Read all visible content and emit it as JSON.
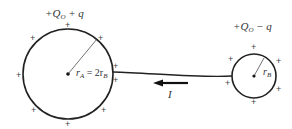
{
  "diagram": {
    "sphere_a": {
      "charge_label_prefix": "+Q",
      "charge_label_sub": "O",
      "charge_label_suffix": " + q",
      "radius_label_r": "r",
      "radius_label_sub": "A",
      "radius_label_eq": " = 2r",
      "radius_label_sub2": "B"
    },
    "sphere_b": {
      "charge_label_prefix": "+Q",
      "charge_label_sub": "O",
      "charge_label_suffix": " − q",
      "radius_label_r": "r",
      "radius_label_sub": "B"
    },
    "current_label": "I",
    "plus_sign": "+",
    "colors": {
      "stroke": "#222222",
      "text": "#333333"
    }
  }
}
